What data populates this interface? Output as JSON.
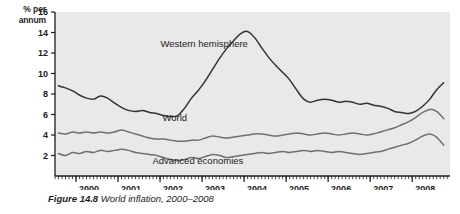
{
  "figure": {
    "caption_label": "Figure 14.8",
    "caption_text": "World inflation, 2000–2008",
    "y_axis_title_line1": "% per",
    "y_axis_title_line2": "annum"
  },
  "chart_data": {
    "type": "line",
    "title": "World inflation, 2000–2008",
    "xlabel": "",
    "ylabel": "% per annum",
    "xlim": [
      1999.5,
      2008.9
    ],
    "ylim": [
      0,
      16
    ],
    "yticks": [
      2,
      4,
      6,
      8,
      10,
      12,
      14,
      16
    ],
    "xticks": [
      2000,
      2001,
      2002,
      2003,
      2004,
      2005,
      2006,
      2007,
      2008
    ],
    "xtick_labels": [
      "2000",
      "2001",
      "2002",
      "2003",
      "2004",
      "2005",
      "2006",
      "2007",
      "2008"
    ],
    "ytick_labels": [
      "2",
      "4",
      "6",
      "8",
      "10",
      "12",
      "14",
      "16"
    ],
    "minor_xticks": "monthly",
    "grid": false,
    "legend_position": "inline-annotations",
    "plot_background": "#e9e9e9",
    "series": [
      {
        "name": "Western hemisphere",
        "color": "#333333",
        "label_x": 2003.05,
        "label_y": 12.6,
        "x": [
          1999.58,
          1999.75,
          1999.92,
          2000.08,
          2000.25,
          2000.42,
          2000.58,
          2000.75,
          2000.92,
          2001.08,
          2001.25,
          2001.42,
          2001.58,
          2001.75,
          2001.92,
          2002.08,
          2002.25,
          2002.42,
          2002.58,
          2002.75,
          2002.92,
          2003.08,
          2003.25,
          2003.42,
          2003.58,
          2003.75,
          2003.92,
          2004.08,
          2004.25,
          2004.42,
          2004.58,
          2004.75,
          2004.92,
          2005.08,
          2005.25,
          2005.42,
          2005.58,
          2005.75,
          2005.92,
          2006.08,
          2006.25,
          2006.42,
          2006.58,
          2006.75,
          2006.92,
          2007.08,
          2007.25,
          2007.42,
          2007.58,
          2007.75,
          2007.92,
          2008.08,
          2008.25,
          2008.42,
          2008.58,
          2008.75
        ],
        "y": [
          8.8,
          8.6,
          8.3,
          7.9,
          7.6,
          7.5,
          7.8,
          7.6,
          7.1,
          6.7,
          6.4,
          6.3,
          6.4,
          6.2,
          6.1,
          5.9,
          5.8,
          5.9,
          6.6,
          7.6,
          8.4,
          9.3,
          10.4,
          11.5,
          12.4,
          13.2,
          13.9,
          14.1,
          13.5,
          12.5,
          11.6,
          10.8,
          10.1,
          9.4,
          8.4,
          7.5,
          7.2,
          7.4,
          7.5,
          7.4,
          7.2,
          7.3,
          7.2,
          7.0,
          7.1,
          6.9,
          6.8,
          6.6,
          6.3,
          6.2,
          6.1,
          6.3,
          6.8,
          7.5,
          8.4,
          9.1
        ]
      },
      {
        "name": "World",
        "color": "#707070",
        "label_x": 2002.35,
        "label_y": 5.4,
        "x": [
          1999.58,
          1999.75,
          1999.92,
          2000.08,
          2000.25,
          2000.42,
          2000.58,
          2000.75,
          2000.92,
          2001.08,
          2001.25,
          2001.42,
          2001.58,
          2001.75,
          2001.92,
          2002.08,
          2002.25,
          2002.42,
          2002.58,
          2002.75,
          2002.92,
          2003.08,
          2003.25,
          2003.42,
          2003.58,
          2003.75,
          2003.92,
          2004.08,
          2004.25,
          2004.42,
          2004.58,
          2004.75,
          2004.92,
          2005.08,
          2005.25,
          2005.42,
          2005.58,
          2005.75,
          2005.92,
          2006.08,
          2006.25,
          2006.42,
          2006.58,
          2006.75,
          2006.92,
          2007.08,
          2007.25,
          2007.42,
          2007.58,
          2007.75,
          2007.92,
          2008.08,
          2008.25,
          2008.42,
          2008.58,
          2008.75
        ],
        "y": [
          4.2,
          4.1,
          4.3,
          4.2,
          4.3,
          4.2,
          4.3,
          4.2,
          4.3,
          4.5,
          4.3,
          4.1,
          3.9,
          3.7,
          3.6,
          3.6,
          3.5,
          3.4,
          3.4,
          3.5,
          3.5,
          3.7,
          3.9,
          3.8,
          3.7,
          3.8,
          3.9,
          4.0,
          4.1,
          4.1,
          4.0,
          3.9,
          4.0,
          4.1,
          4.2,
          4.1,
          4.0,
          4.1,
          4.2,
          4.1,
          4.0,
          4.1,
          4.2,
          4.1,
          4.0,
          4.1,
          4.3,
          4.5,
          4.7,
          5.0,
          5.3,
          5.7,
          6.2,
          6.5,
          6.3,
          5.6
        ]
      },
      {
        "name": "Advanced economies",
        "color": "#707070",
        "label_x": 2002.9,
        "label_y": 1.2,
        "x": [
          1999.58,
          1999.75,
          1999.92,
          2000.08,
          2000.25,
          2000.42,
          2000.58,
          2000.75,
          2000.92,
          2001.08,
          2001.25,
          2001.42,
          2001.58,
          2001.75,
          2001.92,
          2002.08,
          2002.25,
          2002.42,
          2002.58,
          2002.75,
          2002.92,
          2003.08,
          2003.25,
          2003.42,
          2003.58,
          2003.75,
          2003.92,
          2004.08,
          2004.25,
          2004.42,
          2004.58,
          2004.75,
          2004.92,
          2005.08,
          2005.25,
          2005.42,
          2005.58,
          2005.75,
          2005.92,
          2006.08,
          2006.25,
          2006.42,
          2006.58,
          2006.75,
          2006.92,
          2007.08,
          2007.25,
          2007.42,
          2007.58,
          2007.75,
          2007.92,
          2008.08,
          2008.25,
          2008.42,
          2008.58,
          2008.75
        ],
        "y": [
          2.2,
          2.0,
          2.3,
          2.2,
          2.4,
          2.3,
          2.5,
          2.4,
          2.5,
          2.6,
          2.5,
          2.3,
          2.2,
          2.1,
          2.0,
          1.8,
          1.6,
          1.5,
          1.6,
          1.8,
          1.7,
          1.9,
          2.1,
          2.0,
          1.8,
          1.9,
          2.0,
          2.1,
          2.2,
          2.3,
          2.2,
          2.3,
          2.4,
          2.3,
          2.4,
          2.5,
          2.4,
          2.5,
          2.4,
          2.3,
          2.4,
          2.3,
          2.2,
          2.1,
          2.2,
          2.3,
          2.4,
          2.6,
          2.8,
          3.0,
          3.2,
          3.5,
          3.9,
          4.1,
          3.8,
          3.0
        ]
      }
    ]
  },
  "plot_geometry": {
    "left": 55,
    "right": 450,
    "top": 12,
    "bottom": 176
  }
}
